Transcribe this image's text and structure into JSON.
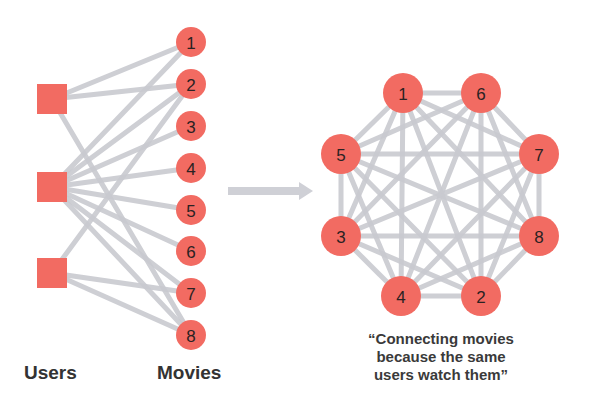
{
  "labels": {
    "users": "Users",
    "movies": "Movies"
  },
  "caption": {
    "line1": "“Connecting movies",
    "line2": "because the same",
    "line3": "users watch them”"
  },
  "colors": {
    "node": "#f26b62",
    "edge": "#c9cad0",
    "arrow": "#cfd0d6",
    "text": "#333333"
  },
  "bipartite": {
    "users": [
      {
        "id": "u1",
        "x": 52,
        "y": 99
      },
      {
        "id": "u2",
        "x": 52,
        "y": 187
      },
      {
        "id": "u3",
        "x": 52,
        "y": 273
      }
    ],
    "movies": [
      {
        "id": "1",
        "x": 191,
        "y": 42
      },
      {
        "id": "2",
        "x": 191,
        "y": 84
      },
      {
        "id": "3",
        "x": 191,
        "y": 126
      },
      {
        "id": "4",
        "x": 191,
        "y": 168
      },
      {
        "id": "5",
        "x": 191,
        "y": 210
      },
      {
        "id": "6",
        "x": 191,
        "y": 251
      },
      {
        "id": "7",
        "x": 191,
        "y": 293
      },
      {
        "id": "8",
        "x": 191,
        "y": 335
      }
    ],
    "edges": [
      [
        "u1",
        "1"
      ],
      [
        "u1",
        "2"
      ],
      [
        "u1",
        "8"
      ],
      [
        "u2",
        "1"
      ],
      [
        "u2",
        "2"
      ],
      [
        "u2",
        "3"
      ],
      [
        "u2",
        "4"
      ],
      [
        "u2",
        "5"
      ],
      [
        "u2",
        "6"
      ],
      [
        "u2",
        "7"
      ],
      [
        "u2",
        "8"
      ],
      [
        "u3",
        "2"
      ],
      [
        "u3",
        "7"
      ],
      [
        "u3",
        "8"
      ]
    ]
  },
  "projection": {
    "nodes": [
      {
        "id": "1",
        "x": 403,
        "y": 93
      },
      {
        "id": "6",
        "x": 481,
        "y": 93
      },
      {
        "id": "5",
        "x": 341,
        "y": 154
      },
      {
        "id": "7",
        "x": 539,
        "y": 154
      },
      {
        "id": "3",
        "x": 341,
        "y": 236
      },
      {
        "id": "8",
        "x": 539,
        "y": 236
      },
      {
        "id": "4",
        "x": 401,
        "y": 296
      },
      {
        "id": "2",
        "x": 481,
        "y": 296
      }
    ],
    "complete_graph": true
  },
  "arrow": {
    "x1": 228,
    "x2": 313,
    "y": 191
  }
}
